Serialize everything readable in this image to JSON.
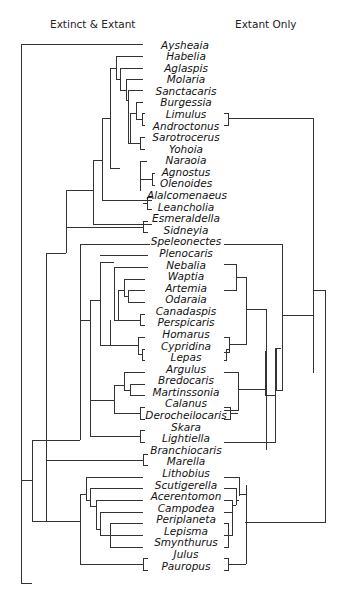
{
  "headers": {
    "left": "Extinct & Extant",
    "right": "Extant Only"
  },
  "colors": {
    "line": "#333333",
    "text": "#111111",
    "background": "#ffffff"
  },
  "taxa": [
    "Aysheaia",
    "Habelia",
    "Aglaspis",
    "Molaria",
    "Sanctacaris",
    "Burgessia",
    "Limulus",
    "Androctonus",
    "Sarotrocerus",
    "Yohoia",
    "Naraoia",
    "Agnostus",
    "Olenoides",
    "Alalcomenaeus",
    "Leancholia",
    "Esmeraldella",
    "Sidneyia",
    "Speleonectes",
    "Plenocaris",
    "Nebalia",
    "Waptia",
    "Artemia",
    "Odaraia",
    "Canadaspis",
    "Perspicaris",
    "Homarus",
    "Cypridina",
    "Lepas",
    "Argulus",
    "Bredocaris",
    "Martinssonia",
    "Calanus",
    "Derocheilocaris",
    "Skara",
    "Lightiella",
    "Branchiocaris",
    "Marella",
    "Lithobius",
    "Scutigerella",
    "Acerentomon",
    "Campodea",
    "Periplaneta",
    "Lepisma",
    "Smynthurus",
    "Julus",
    "Pauropus"
  ],
  "extant_taxa": [
    "Limulus",
    "Androctonus",
    "Speleonectes",
    "Nebalia",
    "Artemia",
    "Homarus",
    "Cypridina",
    "Lepas",
    "Argulus",
    "Calanus",
    "Derocheilocaris",
    "Lightiella",
    "Lithobius",
    "Scutigerella",
    "Acerentomon",
    "Campodea",
    "Periplaneta",
    "Lepisma",
    "Smynthurus",
    "Julus",
    "Pauropus"
  ]
}
